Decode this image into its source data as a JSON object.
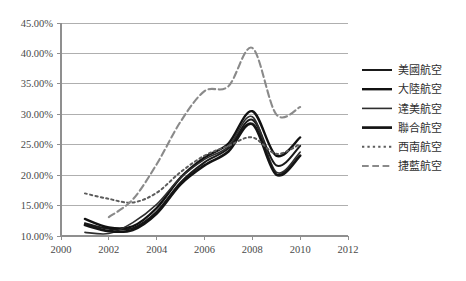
{
  "chart_data": {
    "type": "line",
    "title": "",
    "subtitle": "",
    "xlabel": "",
    "ylabel": "",
    "xlim": [
      2000,
      2012
    ],
    "ylim": [
      0.1,
      0.45
    ],
    "grid": true,
    "grid_axis": "y",
    "legend_position": "right",
    "y_tick_labels": [
      "10.00%",
      "15.00%",
      "20.00%",
      "25.00%",
      "30.00%",
      "35.00%",
      "40.00%",
      "45.00%"
    ],
    "y_tick_values": [
      0.1,
      0.15,
      0.2,
      0.25,
      0.3,
      0.35,
      0.4,
      0.45
    ],
    "x_tick_labels": [
      "2000",
      "2002",
      "2004",
      "2006",
      "2008",
      "2010",
      "2012"
    ],
    "x_tick_values": [
      2000,
      2002,
      2004,
      2006,
      2008,
      2010,
      2012
    ],
    "series": [
      {
        "name": "美國航空",
        "style": "solid",
        "color": "#1a1a1a",
        "width": 2.0,
        "x": [
          2001,
          2002,
          2003,
          2004,
          2005,
          2006,
          2007,
          2008,
          2009,
          2010
        ],
        "values": [
          0.121,
          0.112,
          0.113,
          0.14,
          0.188,
          0.221,
          0.244,
          0.291,
          0.216,
          0.248
        ]
      },
      {
        "name": "大陸航空",
        "style": "solid",
        "color": "#111111",
        "width": 2.4,
        "x": [
          2001,
          2002,
          2003,
          2004,
          2005,
          2006,
          2007,
          2008,
          2009,
          2010
        ],
        "values": [
          0.128,
          0.114,
          0.116,
          0.146,
          0.196,
          0.229,
          0.252,
          0.305,
          0.232,
          0.262
        ]
      },
      {
        "name": "達美航空",
        "style": "solid",
        "color": "#2e2e2e",
        "width": 1.6,
        "x": [
          2001,
          2002,
          2003,
          2004,
          2005,
          2006,
          2007,
          2008,
          2009,
          2010
        ],
        "values": [
          0.106,
          0.104,
          0.122,
          0.152,
          0.196,
          0.226,
          0.247,
          0.296,
          0.205,
          0.238
        ]
      },
      {
        "name": "聯合航空",
        "style": "solid",
        "color": "#141414",
        "width": 2.7,
        "x": [
          2001,
          2002,
          2003,
          2004,
          2005,
          2006,
          2007,
          2008,
          2009,
          2010
        ],
        "values": [
          0.118,
          0.108,
          0.11,
          0.137,
          0.185,
          0.216,
          0.239,
          0.284,
          0.201,
          0.232
        ]
      },
      {
        "name": "西南航空",
        "style": "dotted",
        "color": "#5c5c5c",
        "width": 2.0,
        "x": [
          2001,
          2002,
          2003,
          2004,
          2005,
          2006,
          2007,
          2008,
          2009,
          2010
        ],
        "values": [
          0.17,
          0.161,
          0.155,
          0.171,
          0.205,
          0.232,
          0.248,
          0.262,
          0.235,
          0.251
        ]
      },
      {
        "name": "捷藍航空",
        "style": "dashdot",
        "color": "#8a8a8a",
        "width": 2.1,
        "x": [
          2002,
          2003,
          2004,
          2005,
          2006,
          2007,
          2008,
          2009,
          2010
        ],
        "values": [
          0.131,
          0.16,
          0.218,
          0.288,
          0.338,
          0.346,
          0.409,
          0.3,
          0.312
        ]
      }
    ]
  },
  "legend": {
    "items": [
      {
        "label": "美國航空"
      },
      {
        "label": "大陸航空"
      },
      {
        "label": "達美航空"
      },
      {
        "label": "聯合航空"
      },
      {
        "label": "西南航空"
      },
      {
        "label": "捷藍航空"
      }
    ]
  }
}
